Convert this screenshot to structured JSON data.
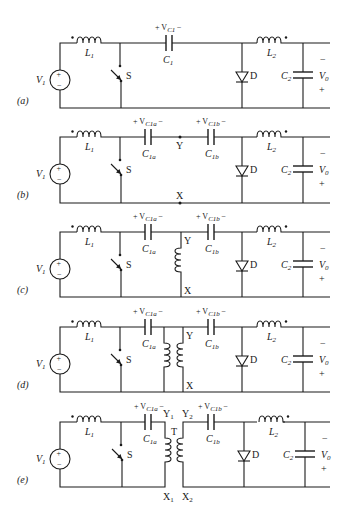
{
  "figure": {
    "circuits": [
      {
        "id": "a",
        "panel_label": "(a)",
        "source_label": "V",
        "source_sub": "1",
        "l1_label": "L",
        "l1_sub": "1",
        "switch_label": "S",
        "cap_labels": [
          {
            "main": "C",
            "sub": "1",
            "voltage_main": "+ V",
            "voltage_sub": "C1",
            "voltage_end": "−"
          }
        ],
        "diode_label": "D",
        "l2_label": "L",
        "l2_sub": "2",
        "c2_label": "C",
        "c2_sub": "2",
        "vo_label": "V",
        "vo_sub": "0",
        "vo_minus": "−",
        "vo_plus": "+"
      },
      {
        "id": "b",
        "panel_label": "(b)",
        "source_label": "V",
        "source_sub": "1",
        "l1_label": "L",
        "l1_sub": "1",
        "switch_label": "S",
        "cap_labels": [
          {
            "main": "C",
            "sub": "1a",
            "voltage_main": "+ V",
            "voltage_sub": "C1a",
            "voltage_end": "−"
          },
          {
            "main": "C",
            "sub": "1b",
            "voltage_main": "+ V",
            "voltage_sub": "C1b",
            "voltage_end": "−"
          }
        ],
        "node_top": "Y",
        "node_bottom": "X",
        "diode_label": "D",
        "l2_label": "L",
        "l2_sub": "2",
        "c2_label": "C",
        "c2_sub": "2",
        "vo_label": "V",
        "vo_sub": "0",
        "vo_minus": "−",
        "vo_plus": "+"
      },
      {
        "id": "c",
        "panel_label": "(c)",
        "source_label": "V",
        "source_sub": "1",
        "l1_label": "L",
        "l1_sub": "1",
        "switch_label": "S",
        "cap_labels": [
          {
            "main": "C",
            "sub": "1a",
            "voltage_main": "+ V",
            "voltage_sub": "C1a",
            "voltage_end": "−"
          },
          {
            "main": "C",
            "sub": "1b",
            "voltage_main": "+ V",
            "voltage_sub": "C1b",
            "voltage_end": "−"
          }
        ],
        "node_top": "Y",
        "node_bottom": "X",
        "diode_label": "D",
        "l2_label": "L",
        "l2_sub": "2",
        "c2_label": "C",
        "c2_sub": "2",
        "vo_label": "V",
        "vo_sub": "0",
        "vo_minus": "−",
        "vo_plus": "+"
      },
      {
        "id": "d",
        "panel_label": "(d)",
        "source_label": "V",
        "source_sub": "1",
        "l1_label": "L",
        "l1_sub": "1",
        "switch_label": "S",
        "cap_labels": [
          {
            "main": "C",
            "sub": "1a",
            "voltage_main": "+ V",
            "voltage_sub": "C1a",
            "voltage_end": "−"
          },
          {
            "main": "C",
            "sub": "1b",
            "voltage_main": "+ V",
            "voltage_sub": "C1b",
            "voltage_end": "−"
          }
        ],
        "node_top": "Y",
        "node_bottom": "X",
        "diode_label": "D",
        "l2_label": "L",
        "l2_sub": "2",
        "c2_label": "C",
        "c2_sub": "2",
        "vo_label": "V",
        "vo_sub": "0",
        "vo_minus": "−",
        "vo_plus": "+"
      },
      {
        "id": "e",
        "panel_label": "(e)",
        "source_label": "V",
        "source_sub": "1",
        "l1_label": "L",
        "l1_sub": "1",
        "switch_label": "S",
        "cap_labels": [
          {
            "main": "C",
            "sub": "1a",
            "voltage_main": "+ V",
            "voltage_sub": "C1a",
            "voltage_end": "−"
          },
          {
            "main": "C",
            "sub": "1b",
            "voltage_main": "+ V",
            "voltage_sub": "C1b",
            "voltage_end": "−"
          }
        ],
        "transformer_label": "T",
        "node_y1": "Y",
        "node_y1_sub": "1",
        "node_y2": "Y",
        "node_y2_sub": "2",
        "node_x1": "X",
        "node_x1_sub": "1",
        "node_x2": "X",
        "node_x2_sub": "2",
        "diode_label": "D",
        "l2_label": "L",
        "l2_sub": "2",
        "c2_label": "C",
        "c2_sub": "2",
        "vo_label": "V",
        "vo_sub": "0",
        "vo_minus": "−",
        "vo_plus": "+"
      }
    ],
    "source_plus": "+",
    "source_minus": "−"
  }
}
